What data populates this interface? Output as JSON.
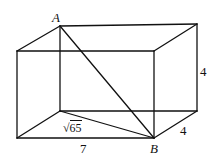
{
  "figure": {
    "type": "rectangular-prism",
    "stroke_color": "#111111",
    "background": "#ffffff",
    "vertices": {
      "A": [
        60,
        26
      ],
      "back_top_right": [
        197,
        24
      ],
      "front_top_left": [
        17,
        51
      ],
      "front_top_right": [
        154,
        51
      ],
      "back_bottom_left": [
        60,
        111
      ],
      "back_bottom_right": [
        197,
        111
      ],
      "front_bottom_left": [
        17,
        138
      ],
      "B": [
        154,
        138
      ]
    },
    "labels": {
      "point_a": "A",
      "point_b": "B",
      "height": "4",
      "depth": "4",
      "length": "7",
      "diagonal_radical_symbol": "√",
      "diagonal_radicand": "65"
    }
  }
}
